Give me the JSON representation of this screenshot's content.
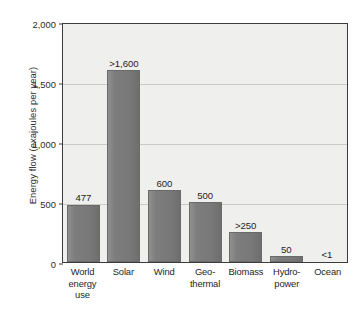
{
  "chart_data": {
    "type": "bar",
    "title": "",
    "subtitle": "",
    "xlabel": "",
    "ylabel": "Energy flow (exajoules per year)",
    "ylim": [
      0,
      2000
    ],
    "ytick_labels": [
      "0",
      "500",
      "1,000",
      "1,500",
      "2,000"
    ],
    "ytick_values": [
      0,
      500,
      1000,
      1500,
      2000
    ],
    "grid": "horizontal",
    "legend": "none",
    "categories": [
      "World energy use",
      "Solar",
      "Wind",
      "Geo-thermal",
      "Biomass",
      "Hydro-power",
      "Ocean"
    ],
    "category_lines": [
      [
        "World",
        "energy use"
      ],
      [
        "Solar",
        ""
      ],
      [
        "Wind",
        ""
      ],
      [
        "Geo-",
        "thermal"
      ],
      [
        "Biomass",
        ""
      ],
      [
        "Hydro-",
        "power"
      ],
      [
        "Ocean",
        ""
      ]
    ],
    "values": [
      477,
      1600,
      600,
      500,
      250,
      50,
      1
    ],
    "value_labels": [
      "477",
      ">1,600",
      "600",
      "500",
      ">250",
      "50",
      "<1"
    ],
    "bars": [
      {
        "category": "World energy use",
        "value": 477,
        "label": "477"
      },
      {
        "category": "Solar",
        "value": 1600,
        "label": ">1,600"
      },
      {
        "category": "Wind",
        "value": 600,
        "label": "600"
      },
      {
        "category": "Geo-thermal",
        "value": 500,
        "label": "500"
      },
      {
        "category": "Biomass",
        "value": 250,
        "label": ">250"
      },
      {
        "category": "Hydro-power",
        "value": 50,
        "label": "50"
      },
      {
        "category": "Ocean",
        "value": 1,
        "label": "<1"
      }
    ],
    "colors": {
      "bar": "#7a7a7a",
      "plot_background": "#efefed",
      "grid": "#c9c9c7",
      "frame": "#3c3c3c",
      "text": "#1e1e1e",
      "page_background": "#ffffff"
    }
  }
}
